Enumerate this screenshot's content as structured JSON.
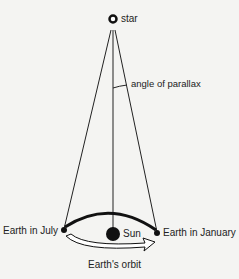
{
  "diagram": {
    "labels": {
      "star": "star",
      "angle": "angle of parallax",
      "july": "Earth in July",
      "sun": "Sun",
      "january": "Earth in January",
      "orbit": "Earth's orbit"
    },
    "colors": {
      "background": "#f4f4f2",
      "ink": "#111111"
    }
  }
}
